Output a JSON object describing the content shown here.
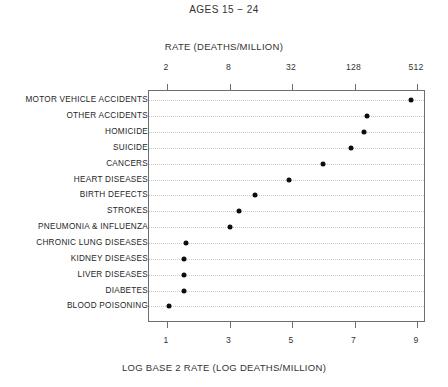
{
  "chart_data": {
    "type": "scatter",
    "title": "AGES 15 − 24",
    "xlabel": "LOG BASE 2 RATE (LOG DEATHS/MILLION)",
    "top_xlabel": "RATE (DEATHS/MILLION)",
    "ylabel": "",
    "orientation": "horizontal-dot-plot",
    "grid": true,
    "legend": false,
    "xlim": [
      0.45,
      9.45
    ],
    "top_axis": {
      "label": "RATE (DEATHS/MILLION)",
      "tick_labels": [
        "2",
        "8",
        "32",
        "128",
        "512"
      ],
      "tick_values": [
        1,
        3,
        5,
        7,
        9
      ],
      "scale": "log2 of deaths per million"
    },
    "bottom_axis": {
      "label": "LOG BASE 2 RATE (LOG DEATHS/MILLION)",
      "tick_labels": [
        "1",
        "3",
        "5",
        "7",
        "9"
      ],
      "tick_values": [
        1,
        3,
        5,
        7,
        9
      ]
    },
    "categories": [
      "MOTOR VEHICLE ACCIDENTS",
      "OTHER ACCIDENTS",
      "HOMICIDE",
      "SUICIDE",
      "CANCERS",
      "HEART DISEASES",
      "BIRTH DEFECTS",
      "STROKES",
      "PNEUMONIA & INFLUENZA",
      "CHRONIC LUNG DISEASES",
      "KIDNEY DISEASES",
      "LIVER DISEASES",
      "DIABETES",
      "BLOOD POISONING"
    ],
    "values": [
      8.8,
      7.4,
      7.3,
      6.9,
      6.0,
      4.9,
      3.8,
      3.3,
      3.0,
      1.6,
      1.55,
      1.55,
      1.55,
      1.05
    ],
    "value_units": "log base 2 rate (log deaths/million)",
    "colors": {
      "marker": "#0d0d0d",
      "frame": "#6e6e6e",
      "gridline": "#c8c8c8",
      "text": "#262626",
      "background": "#ffffff"
    }
  }
}
